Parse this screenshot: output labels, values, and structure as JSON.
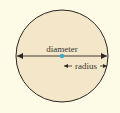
{
  "diagram": {
    "labels": {
      "diameter": "diameter",
      "radius": "radius"
    },
    "colors": {
      "background": "#fdfbe6",
      "circle_fill": "#f3e6c9",
      "stroke": "#2b2622",
      "center_point": "#3fa9c9",
      "text": "#3a3430"
    },
    "circle": {
      "cx": 62,
      "cy": 56,
      "r": 46
    }
  }
}
